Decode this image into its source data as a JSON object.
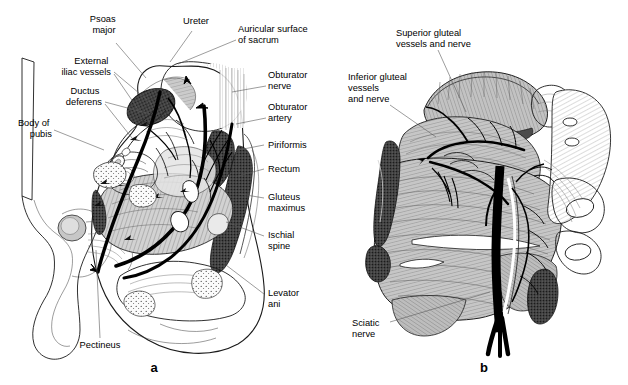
{
  "figure": {
    "background_color": "#ffffff",
    "line_color": "#1a1a1a",
    "muscle_fill": "#c9c9c9",
    "dark_structure_fill": "#3c3c3c",
    "nerve_color": "#000000"
  },
  "panels": [
    {
      "id": "a",
      "letter": "a",
      "caption": "Medial view of the hemipelvis showing pelvic wall muscles, vessels and nerves"
    },
    {
      "id": "b",
      "letter": "b",
      "caption": "Posterior view of the gluteal region showing gluteal vessels and nerves"
    }
  ],
  "panel_a": {
    "letter": "a",
    "labels": [
      {
        "key": "psoas_major",
        "text": "Psoas\nmajor",
        "lines": [
          "Psoas",
          "major"
        ],
        "x": 104,
        "y": 22,
        "anchor": "middle",
        "leader": [
          [
            116,
            43
          ],
          [
            146,
            78
          ]
        ]
      },
      {
        "key": "ureter",
        "text": "Ureter",
        "lines": [
          "Ureter"
        ],
        "x": 196,
        "y": 24,
        "anchor": "middle",
        "leader": [
          [
            192,
            31
          ],
          [
            168,
            66
          ]
        ]
      },
      {
        "key": "auricular_surface",
        "text": "Auricular surface\nof sacrum",
        "lines": [
          "Auricular surface",
          "of sacrum"
        ],
        "x": 238,
        "y": 32,
        "anchor": "start",
        "leader": [
          [
            236,
            40
          ],
          [
            176,
            65
          ]
        ]
      },
      {
        "key": "external_iliac_vessels",
        "text": "External\niliac vessels",
        "lines": [
          "External",
          "iliac vessels"
        ],
        "x": 111,
        "y": 64,
        "anchor": "end",
        "leader": [
          [
            114,
            72
          ],
          [
            152,
            106
          ]
        ]
      },
      {
        "key": "ductus_deferens",
        "text": "Ductus\ndeferens",
        "lines": [
          "Ductus",
          "deferens"
        ],
        "x": 102,
        "y": 94,
        "anchor": "end",
        "leader": [
          [
            105,
            102
          ],
          [
            150,
            116
          ]
        ]
      },
      {
        "key": "body_of_pubis",
        "text": "Body of\npubis",
        "lines": [
          "Body of",
          "pubis"
        ],
        "x": 52,
        "y": 126,
        "anchor": "end",
        "leader": [
          [
            54,
            130
          ],
          [
            104,
            150
          ]
        ]
      },
      {
        "key": "obturator_nerve",
        "text": "Obturator\nnerve",
        "lines": [
          "Obturator",
          "nerve"
        ],
        "x": 268,
        "y": 78,
        "anchor": "start",
        "leader": [
          [
            266,
            86
          ],
          [
            234,
            92
          ]
        ]
      },
      {
        "key": "obturator_artery",
        "text": "Obturator\nartery",
        "lines": [
          "Obturator",
          "artery"
        ],
        "x": 268,
        "y": 110,
        "anchor": "start",
        "leader": [
          [
            266,
            118
          ],
          [
            236,
            122
          ]
        ]
      },
      {
        "key": "piriformis",
        "text": "Piriformis",
        "lines": [
          "Piriformis"
        ],
        "x": 268,
        "y": 148,
        "anchor": "start",
        "leader": [
          [
            264,
            145
          ],
          [
            233,
            152
          ]
        ]
      },
      {
        "key": "rectum",
        "text": "Rectum",
        "lines": [
          "Rectum"
        ],
        "x": 268,
        "y": 172,
        "anchor": "start",
        "leader": [
          [
            264,
            169
          ],
          [
            236,
            175
          ]
        ]
      },
      {
        "key": "gluteus_maximus",
        "text": "Gluteus\nmaximus",
        "lines": [
          "Gluteus",
          "maximus"
        ],
        "x": 268,
        "y": 200,
        "anchor": "start",
        "leader": [
          [
            264,
            198
          ],
          [
            238,
            196
          ]
        ]
      },
      {
        "key": "ischial_spine",
        "text": "Ischial\nspine",
        "lines": [
          "Ischial",
          "spine"
        ],
        "x": 268,
        "y": 238,
        "anchor": "start",
        "leader": [
          [
            264,
            236
          ],
          [
            228,
            222
          ]
        ]
      },
      {
        "key": "levator_ani",
        "text": "Levator\nani",
        "lines": [
          "Levator",
          "ani"
        ],
        "x": 268,
        "y": 296,
        "anchor": "start",
        "leader": [
          [
            264,
            294
          ],
          [
            224,
            262
          ]
        ]
      },
      {
        "key": "pectineus",
        "text": "Pectineus",
        "lines": [
          "Pectineus"
        ],
        "x": 100,
        "y": 348,
        "anchor": "middle",
        "leader": [
          [
            100,
            338
          ],
          [
            96,
            248
          ]
        ]
      }
    ]
  },
  "panel_b": {
    "letter": "b",
    "labels": [
      {
        "key": "superior_gluteal",
        "text": "Superior gluteal\nvessels and nerve",
        "lines": [
          "Superior gluteal",
          "vessels and nerve"
        ],
        "x": 396,
        "y": 36,
        "anchor": "start",
        "leader": [
          [
            438,
            50
          ],
          [
            466,
            112
          ]
        ]
      },
      {
        "key": "inferior_gluteal",
        "text": "Inferior gluteal\nvessels\nand nerve",
        "lines": [
          "Inferior gluteal",
          "vessels",
          "and nerve"
        ],
        "x": 348,
        "y": 80,
        "anchor": "start",
        "leader": [
          [
            390,
            105
          ],
          [
            436,
            136
          ]
        ]
      },
      {
        "key": "sciatic_nerve",
        "text": "Sciatic\nnerve",
        "lines": [
          "Sciatic",
          "nerve"
        ],
        "x": 352,
        "y": 326,
        "anchor": "start",
        "leader": [
          [
            390,
            322
          ],
          [
            488,
            292
          ]
        ]
      }
    ]
  }
}
